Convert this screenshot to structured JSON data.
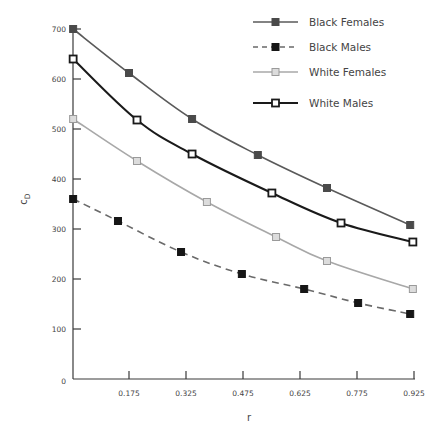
{
  "chart_data": {
    "type": "line",
    "title": "",
    "xlabel": "r",
    "ylabel": "c",
    "ylabel_subscript": "D",
    "xlim": [
      0.025,
      0.925
    ],
    "ylim": [
      0,
      700
    ],
    "grid": false,
    "legend_position": "top-right",
    "x_ticks": [
      0.175,
      0.325,
      0.475,
      0.625,
      0.775,
      0.925
    ],
    "x_tick_labels": [
      "0.175",
      "0.325",
      "0.475",
      "0.625",
      "0.775",
      "0.925"
    ],
    "y_ticks": [
      0,
      100,
      200,
      300,
      400,
      500,
      600,
      700
    ],
    "y_tick_labels": [
      "0",
      "100",
      "200",
      "300",
      "400",
      "500",
      "600",
      "700"
    ],
    "series": [
      {
        "name": "Black Females",
        "line_style": "solid",
        "line_color": "#5a5a5a",
        "marker": "filled-square",
        "marker_fill": "#4a4a4a",
        "marker_stroke": "#4a4a4a",
        "line_width": 1.6,
        "points": [
          {
            "x": 0.028,
            "y": 700
          },
          {
            "x": 0.175,
            "y": 612
          },
          {
            "x": 0.341,
            "y": 520
          },
          {
            "x": 0.514,
            "y": 448
          },
          {
            "x": 0.696,
            "y": 382
          },
          {
            "x": 0.915,
            "y": 308
          }
        ]
      },
      {
        "name": "Black Males",
        "line_style": "dashed",
        "line_color": "#6a6a6a",
        "marker": "filled-square",
        "marker_fill": "#161616",
        "marker_stroke": "#161616",
        "line_width": 1.6,
        "points": [
          {
            "x": 0.028,
            "y": 360
          },
          {
            "x": 0.146,
            "y": 316
          },
          {
            "x": 0.312,
            "y": 254
          },
          {
            "x": 0.472,
            "y": 210
          },
          {
            "x": 0.636,
            "y": 180
          },
          {
            "x": 0.778,
            "y": 152
          },
          {
            "x": 0.915,
            "y": 130
          }
        ]
      },
      {
        "name": "White Females",
        "line_style": "solid",
        "line_color": "#a8a8a8",
        "marker": "light-square",
        "marker_fill": "#dcdcdc",
        "marker_stroke": "#9a9a9a",
        "line_width": 1.6,
        "points": [
          {
            "x": 0.028,
            "y": 520
          },
          {
            "x": 0.196,
            "y": 436
          },
          {
            "x": 0.38,
            "y": 354
          },
          {
            "x": 0.562,
            "y": 284
          },
          {
            "x": 0.696,
            "y": 236
          },
          {
            "x": 0.922,
            "y": 180
          }
        ]
      },
      {
        "name": "White Males",
        "line_style": "solid",
        "line_color": "#1a1a1a",
        "marker": "open-square",
        "marker_fill": "#ffffff",
        "marker_stroke": "#1a1a1a",
        "line_width": 2,
        "points": [
          {
            "x": 0.028,
            "y": 640
          },
          {
            "x": 0.196,
            "y": 518
          },
          {
            "x": 0.341,
            "y": 450
          },
          {
            "x": 0.551,
            "y": 372
          },
          {
            "x": 0.733,
            "y": 312
          },
          {
            "x": 0.922,
            "y": 274
          }
        ]
      }
    ]
  },
  "legend": {
    "items": [
      {
        "label": "Black Females"
      },
      {
        "label": "Black Males"
      },
      {
        "label": "White Females"
      },
      {
        "label": "White Males"
      }
    ]
  }
}
